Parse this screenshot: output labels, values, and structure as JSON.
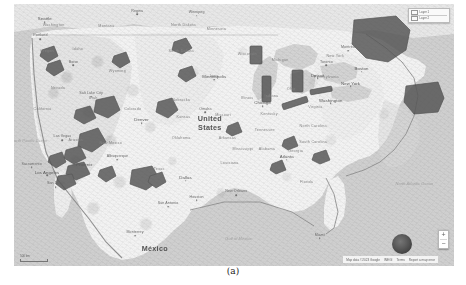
{
  "figure": {
    "caption": "(a)"
  },
  "map": {
    "type": "terrain-map",
    "region": "United States",
    "country_labels": [
      {
        "name": "United States",
        "line1": "United",
        "line2": "States",
        "x": 44.5,
        "y": 45.5
      },
      {
        "name": "México",
        "line1": "México",
        "line2": "",
        "x": 32.0,
        "y": 93.0
      }
    ],
    "state_labels": [
      {
        "label": "Washington",
        "x": 9.0,
        "y": 8.0
      },
      {
        "label": "Montana",
        "x": 21.0,
        "y": 8.5
      },
      {
        "label": "North Dakota",
        "x": 38.5,
        "y": 8.0
      },
      {
        "label": "Minnesota",
        "x": 46.0,
        "y": 9.5
      },
      {
        "label": "Oregon",
        "x": 7.5,
        "y": 18.0
      },
      {
        "label": "Idaho",
        "x": 14.5,
        "y": 17.0
      },
      {
        "label": "South Dakota",
        "x": 38.0,
        "y": 18.0
      },
      {
        "label": "Wisconsin",
        "x": 53.0,
        "y": 19.0
      },
      {
        "label": "Michigan",
        "x": 60.5,
        "y": 21.5
      },
      {
        "label": "Wyoming",
        "x": 23.5,
        "y": 25.5
      },
      {
        "label": "Iowa",
        "x": 45.5,
        "y": 27.5
      },
      {
        "label": "Nebraska",
        "x": 38.0,
        "y": 36.5
      },
      {
        "label": "Nevada",
        "x": 10.0,
        "y": 32.0
      },
      {
        "label": "Utah",
        "x": 18.0,
        "y": 36.0
      },
      {
        "label": "Colorado",
        "x": 27.0,
        "y": 40.0
      },
      {
        "label": "Illinois",
        "x": 53.0,
        "y": 36.0
      },
      {
        "label": "Indiana",
        "x": 58.5,
        "y": 35.0
      },
      {
        "label": "Ohio",
        "x": 63.0,
        "y": 32.5
      },
      {
        "label": "Pennsylvania",
        "x": 71.0,
        "y": 28.0
      },
      {
        "label": "New York",
        "x": 73.0,
        "y": 20.0
      },
      {
        "label": "Missouri",
        "x": 47.5,
        "y": 42.5
      },
      {
        "label": "Kansas",
        "x": 38.5,
        "y": 43.0
      },
      {
        "label": "Kentucky",
        "x": 58.0,
        "y": 42.0
      },
      {
        "label": "Virginia",
        "x": 68.5,
        "y": 39.5
      },
      {
        "label": "California",
        "x": 6.5,
        "y": 40.0
      },
      {
        "label": "Arizona",
        "x": 14.0,
        "y": 52.0
      },
      {
        "label": "New Mexico",
        "x": 22.0,
        "y": 53.0
      },
      {
        "label": "Oklahoma",
        "x": 38.0,
        "y": 51.0
      },
      {
        "label": "Arkansas",
        "x": 48.5,
        "y": 51.0
      },
      {
        "label": "Tennessee",
        "x": 57.0,
        "y": 48.0
      },
      {
        "label": "North Carolina",
        "x": 68.0,
        "y": 46.5
      },
      {
        "label": "South Carolina",
        "x": 68.0,
        "y": 52.5
      },
      {
        "label": "Georgia",
        "x": 64.0,
        "y": 56.0
      },
      {
        "label": "Alabama",
        "x": 57.5,
        "y": 55.5
      },
      {
        "label": "Mississippi",
        "x": 52.0,
        "y": 55.5
      },
      {
        "label": "Louisiana",
        "x": 49.0,
        "y": 60.5
      },
      {
        "label": "Texas",
        "x": 33.0,
        "y": 63.0
      },
      {
        "label": "Florida",
        "x": 66.5,
        "y": 68.0
      }
    ],
    "city_labels": [
      {
        "label": "Seattle",
        "x": 7.0,
        "y": 5.5,
        "major": true,
        "dot": true
      },
      {
        "label": "Portland",
        "x": 6.0,
        "y": 12.0,
        "major": false,
        "dot": true
      },
      {
        "label": "Boise",
        "x": 13.5,
        "y": 22.0,
        "major": false,
        "dot": true
      },
      {
        "label": "Minneapolis",
        "x": 45.5,
        "y": 27.5,
        "major": true,
        "dot": true
      },
      {
        "label": "Omaha",
        "x": 43.5,
        "y": 40.0,
        "major": false,
        "dot": true
      },
      {
        "label": "Chicago",
        "x": 56.5,
        "y": 37.5,
        "major": true,
        "dot": true
      },
      {
        "label": "Detroit",
        "x": 69.0,
        "y": 27.0,
        "major": true,
        "dot": true
      },
      {
        "label": "Toronto",
        "x": 71.0,
        "y": 22.0,
        "major": false,
        "dot": true
      },
      {
        "label": "Denver",
        "x": 29.0,
        "y": 44.0,
        "major": true,
        "dot": true
      },
      {
        "label": "Salt Lake City",
        "x": 17.5,
        "y": 34.0,
        "major": false,
        "dot": true
      },
      {
        "label": "Sacramento",
        "x": 4.0,
        "y": 61.0,
        "major": false,
        "dot": true
      },
      {
        "label": "Las Vegas",
        "x": 11.0,
        "y": 50.5,
        "major": false,
        "dot": true
      },
      {
        "label": "Los Angeles",
        "x": 7.5,
        "y": 64.0,
        "major": true,
        "dot": true
      },
      {
        "label": "San Diego",
        "x": 9.5,
        "y": 68.5,
        "major": false,
        "dot": true
      },
      {
        "label": "Phoenix",
        "x": 16.0,
        "y": 61.0,
        "major": true,
        "dot": true
      },
      {
        "label": "Albuquerque",
        "x": 23.5,
        "y": 58.0,
        "major": false,
        "dot": true
      },
      {
        "label": "Dallas",
        "x": 39.0,
        "y": 66.0,
        "major": true,
        "dot": true
      },
      {
        "label": "Houston",
        "x": 41.5,
        "y": 73.5,
        "major": false,
        "dot": true
      },
      {
        "label": "San Antonio",
        "x": 35.0,
        "y": 76.0,
        "major": false,
        "dot": true
      },
      {
        "label": "New Orleans",
        "x": 50.5,
        "y": 71.5,
        "major": false,
        "dot": true
      },
      {
        "label": "Atlanta",
        "x": 62.0,
        "y": 58.0,
        "major": true,
        "dot": true
      },
      {
        "label": "Miami",
        "x": 69.5,
        "y": 88.0,
        "major": false,
        "dot": true
      },
      {
        "label": "Washington",
        "x": 72.0,
        "y": 36.5,
        "major": true,
        "dot": true
      },
      {
        "label": "New York",
        "x": 76.5,
        "y": 30.0,
        "major": true,
        "dot": true
      },
      {
        "label": "Boston",
        "x": 79.0,
        "y": 24.5,
        "major": true,
        "dot": true
      },
      {
        "label": "Montréal",
        "x": 76.0,
        "y": 16.5,
        "major": false,
        "dot": true
      },
      {
        "label": "Monterrey",
        "x": 27.5,
        "y": 87.0,
        "major": false,
        "dot": true
      },
      {
        "label": "Regina",
        "x": 28.0,
        "y": 2.5,
        "major": false,
        "dot": true
      },
      {
        "label": "Winnipeg",
        "x": 41.5,
        "y": 3.0,
        "major": false,
        "dot": true
      }
    ],
    "water_labels": [
      {
        "label": "North Pacific Ocean",
        "x": 3.5,
        "y": 52.0
      },
      {
        "label": "North Atlantic Ocean",
        "x": 91.0,
        "y": 68.5
      },
      {
        "label": "Gulf of Mexico",
        "x": 51.0,
        "y": 89.5
      }
    ],
    "overlay": {
      "description": "dark shaded data regions",
      "fill_color": "#4b4b4b",
      "stroke_color": "#2e2e2e",
      "region_count": 24
    },
    "legend": {
      "rows": [
        {
          "label": "Layer 1"
        },
        {
          "label": "Layer 2"
        }
      ]
    },
    "zoom_control": {
      "zoom_in_label": "+",
      "zoom_out_label": "−"
    },
    "attribution": {
      "items": [
        "Map data ©2023 Google",
        "INEGI",
        "Terms",
        "Report a map error"
      ]
    },
    "scale": {
      "distance": "500 km"
    },
    "cluster_marker": {
      "name": "data-cluster-blob",
      "color": "#3a3a3a"
    }
  }
}
